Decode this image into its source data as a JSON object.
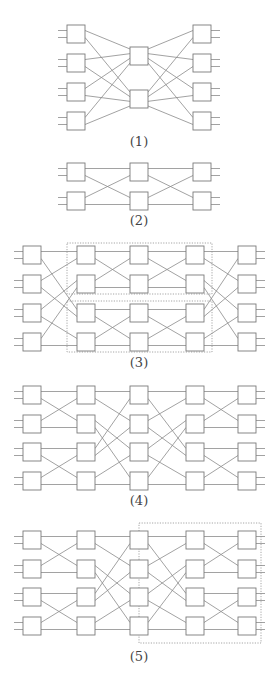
{
  "figure": {
    "background": "#ffffff",
    "line_color": "#8a8a8a",
    "box_color": "#7a7a7a",
    "box_size": 18,
    "port_offset": 3.5
  },
  "diagrams": [
    {
      "id": "1",
      "label": "(1)",
      "label_pos": [
        139,
        134
      ],
      "columns_x": [
        67,
        130,
        193
      ],
      "boxes": [
        {
          "col": 0,
          "y": 25
        },
        {
          "col": 0,
          "y": 54
        },
        {
          "col": 0,
          "y": 83
        },
        {
          "col": 0,
          "y": 112
        },
        {
          "col": 1,
          "y": 47,
          "ports": 4
        },
        {
          "col": 1,
          "y": 90,
          "ports": 4
        },
        {
          "col": 2,
          "y": 25
        },
        {
          "col": 2,
          "y": 54
        },
        {
          "col": 2,
          "y": 83
        },
        {
          "col": 2,
          "y": 112
        }
      ],
      "links": [
        [
          0,
          0,
          4,
          0
        ],
        [
          0,
          1,
          5,
          0
        ],
        [
          1,
          0,
          4,
          1
        ],
        [
          1,
          1,
          5,
          1
        ],
        [
          2,
          0,
          4,
          2
        ],
        [
          2,
          1,
          5,
          2
        ],
        [
          3,
          0,
          4,
          3
        ],
        [
          3,
          1,
          5,
          3
        ],
        [
          4,
          0,
          6,
          0
        ],
        [
          5,
          0,
          6,
          1
        ],
        [
          4,
          1,
          7,
          0
        ],
        [
          5,
          1,
          7,
          1
        ],
        [
          4,
          2,
          8,
          0
        ],
        [
          5,
          2,
          8,
          1
        ],
        [
          4,
          3,
          9,
          0
        ],
        [
          5,
          3,
          9,
          1
        ]
      ],
      "inputs": [
        0,
        1,
        2,
        3
      ],
      "outputs": [
        6,
        7,
        8,
        9
      ],
      "dotted_boxes": []
    },
    {
      "id": "2",
      "label": "(2)",
      "label_pos": [
        139,
        213
      ],
      "columns_x": [
        67,
        130,
        193
      ],
      "boxes": [
        {
          "col": 0,
          "y": 163
        },
        {
          "col": 0,
          "y": 192
        },
        {
          "col": 1,
          "y": 163
        },
        {
          "col": 1,
          "y": 192
        },
        {
          "col": 2,
          "y": 163
        },
        {
          "col": 2,
          "y": 192
        }
      ],
      "links": [
        [
          0,
          0,
          2,
          0
        ],
        [
          0,
          1,
          3,
          0
        ],
        [
          1,
          0,
          2,
          1
        ],
        [
          1,
          1,
          3,
          1
        ],
        [
          2,
          0,
          4,
          0
        ],
        [
          2,
          1,
          5,
          0
        ],
        [
          3,
          0,
          4,
          1
        ],
        [
          3,
          1,
          5,
          1
        ]
      ],
      "inputs": [
        0,
        1
      ],
      "outputs": [
        4,
        5
      ],
      "dotted_boxes": []
    },
    {
      "id": "3",
      "label": "(3)",
      "label_pos": [
        139,
        355
      ],
      "columns_x": [
        23,
        77,
        130,
        186,
        238
      ],
      "rows_y": [
        246,
        275,
        304,
        333
      ],
      "grid": true,
      "stages": [
        "unshuffle",
        "pair",
        "pair",
        "shuffle"
      ],
      "dotted_boxes": [
        {
          "x": 67,
          "y": 243,
          "w": 145,
          "h": 51
        },
        {
          "x": 67,
          "y": 301,
          "w": 145,
          "h": 51
        }
      ]
    },
    {
      "id": "4",
      "label": "(4)",
      "label_pos": [
        139,
        493
      ],
      "columns_x": [
        23,
        77,
        130,
        186,
        238
      ],
      "rows_y": [
        386,
        415,
        443,
        472
      ],
      "grid": true,
      "stages": [
        "pair",
        "shuffle",
        "unshuffle",
        "pair"
      ],
      "dotted_boxes": []
    },
    {
      "id": "5",
      "label": "(5)",
      "label_pos": [
        139,
        649
      ],
      "columns_x": [
        23,
        77,
        130,
        186,
        238
      ],
      "rows_y": [
        531,
        560,
        588,
        617
      ],
      "grid": true,
      "stages": [
        "pair",
        "shuffle",
        "unshuffle",
        "pair"
      ],
      "dotted_boxes": [
        {
          "x": 139,
          "y": 523,
          "w": 122,
          "h": 120
        }
      ]
    }
  ],
  "stage_patterns": {
    "pair": [
      [
        0,
        0,
        0,
        0
      ],
      [
        0,
        1,
        1,
        0
      ],
      [
        1,
        0,
        0,
        1
      ],
      [
        1,
        1,
        1,
        1
      ],
      [
        2,
        0,
        2,
        0
      ],
      [
        2,
        1,
        3,
        0
      ],
      [
        3,
        0,
        2,
        1
      ],
      [
        3,
        1,
        3,
        1
      ]
    ],
    "shuffle": [
      [
        0,
        0,
        0,
        0
      ],
      [
        0,
        1,
        1,
        0
      ],
      [
        1,
        0,
        2,
        0
      ],
      [
        1,
        1,
        3,
        0
      ],
      [
        2,
        0,
        0,
        1
      ],
      [
        2,
        1,
        1,
        1
      ],
      [
        3,
        0,
        2,
        1
      ],
      [
        3,
        1,
        3,
        1
      ]
    ],
    "unshuffle": [
      [
        0,
        0,
        0,
        0
      ],
      [
        0,
        1,
        2,
        0
      ],
      [
        1,
        0,
        0,
        1
      ],
      [
        1,
        1,
        2,
        1
      ],
      [
        2,
        0,
        1,
        0
      ],
      [
        2,
        1,
        3,
        0
      ],
      [
        3,
        0,
        1,
        1
      ],
      [
        3,
        1,
        3,
        1
      ]
    ]
  }
}
